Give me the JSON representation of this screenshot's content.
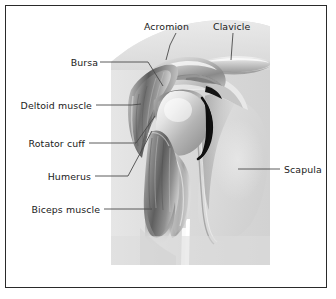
{
  "figure": {
    "type": "medical-illustration",
    "style": "grayscale-airbrush",
    "frame_color": "#2a2a2a",
    "background_color": "#ffffff",
    "panel_color": "#dcdcdc",
    "text_color": "#1a1a1a",
    "leader_color": "#4a4a4a"
  },
  "labels": {
    "acromion": "Acromion",
    "clavicle": "Clavicle",
    "bursa": "Bursa",
    "deltoid": "Deltoid muscle",
    "rotator_cuff": "Rotator cuff",
    "humerus": "Humerus",
    "biceps": "Biceps muscle",
    "scapula": "Scapula"
  },
  "structures": [
    {
      "name": "Acromion",
      "side": "top"
    },
    {
      "name": "Clavicle",
      "side": "top"
    },
    {
      "name": "Bursa",
      "side": "left"
    },
    {
      "name": "Deltoid muscle",
      "side": "left"
    },
    {
      "name": "Rotator cuff",
      "side": "left"
    },
    {
      "name": "Humerus",
      "side": "left"
    },
    {
      "name": "Biceps muscle",
      "side": "left"
    },
    {
      "name": "Scapula",
      "side": "right"
    }
  ]
}
